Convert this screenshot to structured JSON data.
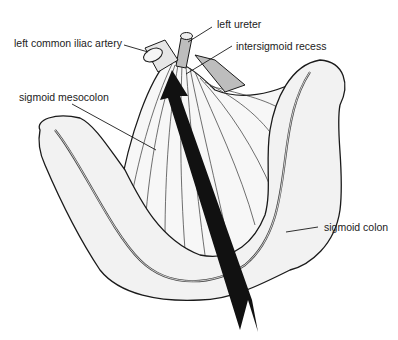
{
  "figure": {
    "labels": {
      "left_common_iliac_artery": "left common iliac artery",
      "left_ureter": "left ureter",
      "intersigmoid_recess": "intersigmoid recess",
      "sigmoid_mesocolon": "sigmoid mesocolon",
      "sigmoid_colon": "sigmoid colon"
    },
    "colors": {
      "line": "#1a1a1a",
      "fill_light": "#f2f2f2",
      "fill_shade": "#bdbdbd",
      "arrow": "#111111"
    }
  }
}
